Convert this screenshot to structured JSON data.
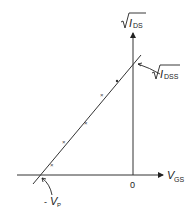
{
  "diagram": {
    "type": "jfet-transfer-characteristic",
    "axes": {
      "y_label_main": "I",
      "y_label_sub": "DS",
      "x_label_main": "V",
      "x_label_sub": "GS",
      "origin_label": "0"
    },
    "annotations": {
      "idss_main": "I",
      "idss_sub": "DSS",
      "vp_prefix": "- ",
      "vp_main": "V",
      "vp_sub": "P"
    },
    "data_point_marker": "×",
    "data_points_count": 5
  }
}
